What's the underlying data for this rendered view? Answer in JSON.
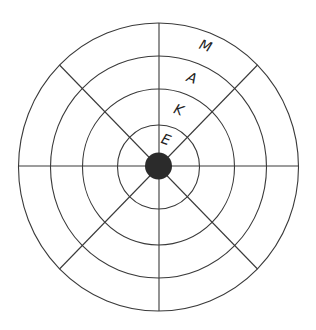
{
  "diagram": {
    "type": "concentric-rings-target",
    "center": {
      "x": 158.5,
      "y": 167
    },
    "rings_radii": [
      {
        "rx": 41,
        "ry": 42
      },
      {
        "rx": 76,
        "ry": 78
      },
      {
        "rx": 108,
        "ry": 111
      },
      {
        "rx": 140,
        "ry": 144
      }
    ],
    "spoke_angles_deg": [
      0,
      45,
      90,
      135,
      180,
      225,
      270,
      315
    ],
    "center_dot": {
      "r": 13,
      "color": "#2b2b2b"
    },
    "line_color": "#3a3a3a",
    "labels": [
      {
        "text": "E",
        "ring": 1
      },
      {
        "text": "K",
        "ring": 2
      },
      {
        "text": "A",
        "ring": 3
      },
      {
        "text": "M",
        "ring": 4
      }
    ]
  }
}
